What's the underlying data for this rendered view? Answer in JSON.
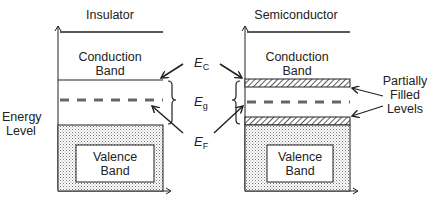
{
  "diagram": {
    "type": "energy-band-diagram",
    "panels": [
      {
        "title": "Insulator",
        "conduction_band": [
          "Conduction",
          "Band"
        ],
        "valence_band": [
          "Valence",
          "Band"
        ]
      },
      {
        "title": "Semiconductor",
        "conduction_band": [
          "Conduction",
          "Band"
        ],
        "valence_band": [
          "Valence",
          "Band"
        ]
      }
    ],
    "axis_label": [
      "Energy",
      "Level"
    ],
    "symbols": {
      "ec": {
        "main": "E",
        "sub": "C"
      },
      "eg": {
        "main": "E",
        "sub": "g"
      },
      "ef": {
        "main": "E",
        "sub": "F"
      }
    },
    "annotation": [
      "Partially",
      "Filled",
      "Levels"
    ],
    "colors": {
      "line": "#222222",
      "dashed": "#666666",
      "stipple": "#bdbdbd"
    }
  }
}
